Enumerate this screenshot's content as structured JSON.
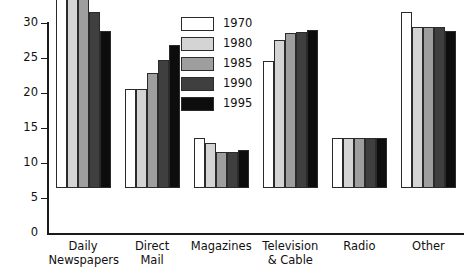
{
  "chart_data": {
    "type": "bar",
    "title": "",
    "subtitle": "",
    "xlabel": "",
    "ylabel": "",
    "ylim": [
      0,
      30
    ],
    "ytick_values": [
      0,
      5,
      10,
      15,
      20,
      25,
      30
    ],
    "ytick_labels": [
      "0",
      "5",
      "10",
      "15",
      "20",
      "25",
      "30"
    ],
    "grid": false,
    "legend_position": "top-center",
    "categories": [
      "Daily\nNewspapers",
      "Direct\nMail",
      "Magazines",
      "Television\n& Cable",
      "Radio",
      "Other"
    ],
    "series": [
      {
        "name": "1970",
        "color": "#ffffff",
        "values": [
          29.2,
          14.2,
          7.2,
          18.2,
          7.2,
          25.1
        ]
      },
      {
        "name": "1980",
        "color": "#d4d4d4",
        "values": [
          28.1,
          14.2,
          6.4,
          21.2,
          7.2,
          23.0
        ]
      },
      {
        "name": "1985",
        "color": "#9e9e9e",
        "values": [
          27.3,
          16.4,
          5.2,
          22.1,
          7.2,
          23.0
        ]
      },
      {
        "name": "1990",
        "color": "#3f3f3f",
        "values": [
          25.1,
          18.3,
          5.1,
          22.3,
          7.2,
          23.0
        ]
      },
      {
        "name": "1995",
        "color": "#0d0d0d",
        "values": [
          22.5,
          20.5,
          5.5,
          22.6,
          7.2,
          22.4
        ]
      }
    ]
  },
  "legend": {
    "entries": [
      {
        "label": "1970",
        "color": "#ffffff"
      },
      {
        "label": "1980",
        "color": "#d4d4d4"
      },
      {
        "label": "1985",
        "color": "#9e9e9e"
      },
      {
        "label": "1990",
        "color": "#3f3f3f"
      },
      {
        "label": "1995",
        "color": "#0d0d0d"
      }
    ]
  },
  "axis": {
    "border_color": "#1a1a1a",
    "bar_outline_color": "#2b2b2b"
  }
}
